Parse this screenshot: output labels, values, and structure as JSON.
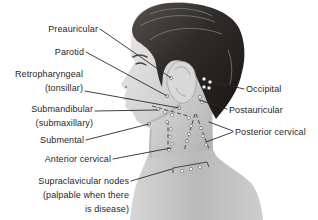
{
  "labels": {
    "preauricular": "Preauricular",
    "parotid": "Parotid",
    "retropharyngeal": "Retropharyngeal\n(tonsillar)",
    "submandibular": "Submandibular\n(submaxillary)",
    "submental": "Submental",
    "anterior_cervical": "Anterior cervical",
    "supraclavicular": "Supraclavicular nodes\n(palpable when there\nis disease)",
    "occipital": "Occipital",
    "postauricular": "Postauricular",
    "posterior_cervical": "Posterior cervical"
  },
  "colors": {
    "background": "#ffffff",
    "label_text": "#1f1f1f",
    "leader_line": "#2a2a2a",
    "node_fill": "#ffffff",
    "node_stroke": "#5f5f5f",
    "hair_dark": "#221e1c",
    "skin_light": "#e9e9e9",
    "skin_shadow": "#aeaeae"
  }
}
